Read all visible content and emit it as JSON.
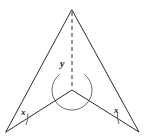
{
  "figure": {
    "background_color": "#ffffff",
    "stroke_color": "#2b2b2b",
    "stroke_width": 1,
    "dash_color": "#2b2b2b",
    "arc_color": "#555555",
    "labels": {
      "reflex_angle": "y",
      "base_angle_left": "x",
      "base_angle_right": "x"
    },
    "vertices": {
      "apex": {
        "x": 72,
        "y": 10
      },
      "bottom_left": {
        "x": 6,
        "y": 132
      },
      "bottom_right": {
        "x": 139,
        "y": 132
      },
      "reflex_center": {
        "x": 72,
        "y": 90
      }
    },
    "outline_path": "M 72 10 L 139 132 L 72 90 L 6 132 Z",
    "dashed_axis": {
      "x1": 72,
      "y1": 12,
      "x2": 72,
      "y2": 88,
      "dash": "4 3"
    },
    "reflex_arc": {
      "center_x": 72,
      "center_y": 90,
      "radius": 20,
      "path": "M 59.6 74.4 A 20 20 0 1 0 84.4 74.4"
    },
    "left_angle_arc": {
      "path": "M 27.8 113.6 A 22 22 0 0 1 26.0 125.0",
      "vertex_x": 6,
      "vertex_y": 132
    },
    "right_angle_arc": {
      "path": "M 119.0 124.0 A 22 22 0 0 1 117.6 112.6",
      "vertex_x": 139,
      "vertex_y": 132
    }
  }
}
